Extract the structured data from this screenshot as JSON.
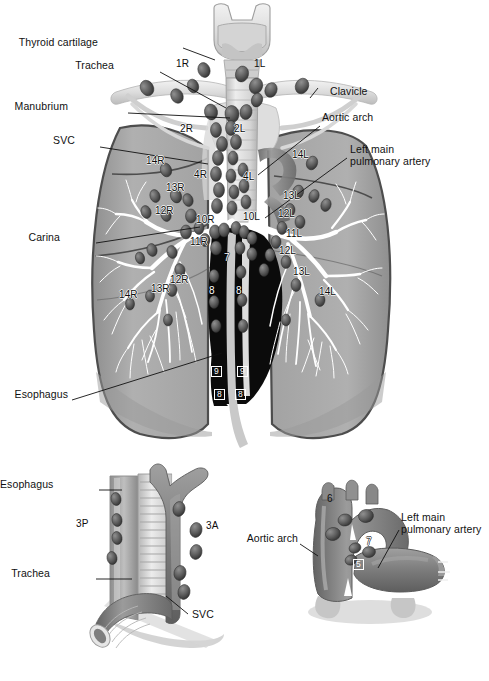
{
  "figure": {
    "background_color": "#ffffff",
    "width": 489,
    "height": 681
  },
  "palette": {
    "lung_fill": "#a9a9a9",
    "lung_fill_light": "#b9b9b9",
    "lung_outline": "#4a4a4a",
    "airway_light": "#e3e3e3",
    "airway_mid": "#c9c9c9",
    "node_dark": "#5a5a5a",
    "node_darker": "#3f3f3f",
    "mediastinum_black": "#0b0b0b",
    "vessel_gray": "#8e8e8e",
    "vessel_dark": "#6f6f6f",
    "leader_line": "#111111",
    "label_text": "#111111",
    "white": "#ffffff"
  },
  "panels": {
    "main": {
      "name": "Anterior view of tracheobronchial tree, lungs and nodal stations",
      "annotations": [
        {
          "id": "thyroid-cartilage",
          "text": "Thyroid cartilage",
          "align": "right",
          "x": 98,
          "y": 42,
          "leader": {
            "x1": 183,
            "y1": 48,
            "x2": 215,
            "y2": 60
          }
        },
        {
          "id": "trachea",
          "text": "Trachea",
          "align": "right",
          "x": 114,
          "y": 65,
          "leader": {
            "x1": 160,
            "y1": 72,
            "x2": 226,
            "y2": 108
          }
        },
        {
          "id": "manubrium",
          "text": "Manubrium",
          "align": "right",
          "x": 68,
          "y": 106,
          "leader": {
            "x1": 128,
            "y1": 113,
            "x2": 230,
            "y2": 118
          }
        },
        {
          "id": "svc",
          "text": "SVC",
          "align": "right",
          "x": 75,
          "y": 140,
          "leader": {
            "x1": 100,
            "y1": 147,
            "x2": 208,
            "y2": 164
          }
        },
        {
          "id": "carina",
          "text": "Carina",
          "align": "right",
          "x": 60,
          "y": 237,
          "leader": {
            "x1": 96,
            "y1": 243,
            "x2": 200,
            "y2": 227
          }
        },
        {
          "id": "esophagus",
          "text": "Esophagus",
          "align": "right",
          "x": 8,
          "y": 394,
          "leader": {
            "x1": 72,
            "y1": 400,
            "x2": 222,
            "y2": 353
          }
        },
        {
          "id": "clavicle",
          "text": "Clavicle",
          "align": "left",
          "x": 330,
          "y": 92,
          "leader": {
            "x1": 310,
            "y1": 98,
            "x2": 318,
            "y2": 88
          }
        },
        {
          "id": "aortic-arch",
          "text": "Aortic arch",
          "align": "left",
          "x": 322,
          "y": 118,
          "leader": {
            "x1": 320,
            "y1": 126,
            "x2": 258,
            "y2": 175
          }
        },
        {
          "id": "left-main-pulmonary-artery",
          "text": "Left main\npulmonary artery",
          "align": "left",
          "x": 350,
          "y": 150,
          "leader": {
            "x1": 347,
            "y1": 158,
            "x2": 265,
            "y2": 218
          }
        }
      ],
      "stations": [
        {
          "label": "1R",
          "x": 182,
          "y": 64,
          "style": "onwhite"
        },
        {
          "label": "1L",
          "x": 258,
          "y": 64,
          "style": "onwhite"
        },
        {
          "label": "2R",
          "x": 186,
          "y": 129,
          "style": "plain"
        },
        {
          "label": "2L",
          "x": 237,
          "y": 129,
          "style": "plain"
        },
        {
          "label": "14R",
          "x": 152,
          "y": 159,
          "style": "plain"
        },
        {
          "label": "14L",
          "x": 297,
          "y": 153,
          "style": "plain"
        },
        {
          "label": "4R",
          "x": 197,
          "y": 174,
          "style": "plain"
        },
        {
          "label": "4L",
          "x": 245,
          "y": 176,
          "style": "plain"
        },
        {
          "label": "13R",
          "x": 172,
          "y": 187,
          "style": "plain"
        },
        {
          "label": "13L",
          "x": 287,
          "y": 195,
          "style": "plain"
        },
        {
          "label": "12R",
          "x": 161,
          "y": 210,
          "style": "plain"
        },
        {
          "label": "12L",
          "x": 282,
          "y": 213,
          "style": "plain"
        },
        {
          "label": "10R",
          "x": 202,
          "y": 219,
          "style": "plain"
        },
        {
          "label": "10L",
          "x": 246,
          "y": 216,
          "style": "plain"
        },
        {
          "label": "11L",
          "x": 290,
          "y": 233,
          "style": "plain"
        },
        {
          "label": "11R",
          "x": 196,
          "y": 241,
          "style": "plain"
        },
        {
          "label": "7",
          "x": 226,
          "y": 257,
          "style": "onblack"
        },
        {
          "label": "12R",
          "x": 176,
          "y": 279,
          "style": "plain"
        },
        {
          "label": "12L",
          "x": 283,
          "y": 250,
          "style": "plain"
        },
        {
          "label": "13R",
          "x": 157,
          "y": 288,
          "style": "plain"
        },
        {
          "label": "13L",
          "x": 297,
          "y": 271,
          "style": "plain"
        },
        {
          "label": "14R",
          "x": 125,
          "y": 294,
          "style": "plain"
        },
        {
          "label": "14L",
          "x": 324,
          "y": 291,
          "style": "plain"
        },
        {
          "label": "8",
          "x": 212,
          "y": 290,
          "style": "onblack"
        },
        {
          "label": "8",
          "x": 239,
          "y": 290,
          "style": "onblack"
        },
        {
          "label": "9",
          "x": 214,
          "y": 370,
          "style": "boxed"
        },
        {
          "label": "9",
          "x": 240,
          "y": 370,
          "style": "boxed"
        },
        {
          "label": "8",
          "x": 217,
          "y": 392,
          "style": "boxed"
        },
        {
          "label": "8",
          "x": 238,
          "y": 392,
          "style": "boxed"
        }
      ]
    },
    "lower_left": {
      "name": "Detail: trachea, esophagus and SVC with stations 3A and 3P",
      "annotations": [
        {
          "id": "esophagus-detail",
          "text": "Esophagus",
          "align": "right",
          "x": 36,
          "y": 484,
          "leader": {
            "x1": 99,
            "y1": 490,
            "x2": 122,
            "y2": 490
          }
        },
        {
          "id": "trachea-detail",
          "text": "Trachea",
          "align": "right",
          "x": 50,
          "y": 573,
          "leader": {
            "x1": 96,
            "y1": 579,
            "x2": 132,
            "y2": 579
          }
        },
        {
          "id": "svc-detail",
          "text": "SVC",
          "align": "left",
          "x": 190,
          "y": 614,
          "leader": {
            "x1": 188,
            "y1": 614,
            "x2": 166,
            "y2": 596
          }
        }
      ],
      "stations": [
        {
          "label": "3P",
          "x": 82,
          "y": 524,
          "style": "onwhite"
        },
        {
          "label": "3A",
          "x": 210,
          "y": 526,
          "style": "onwhite"
        }
      ]
    },
    "lower_right": {
      "name": "Detail: aortic arch and left main pulmonary artery with stations 5, 6 and 7",
      "annotations": [
        {
          "id": "aortic-arch-detail",
          "text": "Aortic arch",
          "align": "right",
          "x": 241,
          "y": 538,
          "leader": {
            "x1": 300,
            "y1": 544,
            "x2": 318,
            "y2": 556
          }
        },
        {
          "id": "left-main-pa-detail",
          "text": "Left main\npulmonary artery",
          "align": "left",
          "x": 401,
          "y": 518,
          "leader": {
            "x1": 399,
            "y1": 530,
            "x2": 378,
            "y2": 568
          }
        }
      ],
      "stations": [
        {
          "label": "6",
          "x": 330,
          "y": 499,
          "style": "onwhite"
        },
        {
          "label": "7",
          "x": 369,
          "y": 541,
          "style": "onblack"
        },
        {
          "label": "5",
          "x": 356,
          "y": 563,
          "style": "boxed"
        }
      ]
    }
  }
}
